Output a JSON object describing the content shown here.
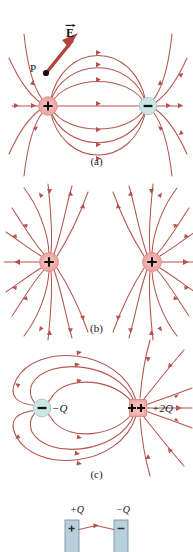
{
  "figure": {
    "colors": {
      "field_line": "#b5544f",
      "field_line_light": "#c77a74",
      "positive_charge_fill": "#f0a9a4",
      "positive_charge_edge": "#d07c77",
      "negative_charge_fill": "#c9e6e4",
      "negative_charge_edge": "#9fc9c6",
      "plate_fill": "#b9cfdc",
      "plate_edge": "#7b95a5",
      "text": "#151515",
      "background": "#ffffff"
    }
  },
  "panel_a": {
    "caption": "(a)",
    "description": "Electric dipole: equal positive and negative point charges",
    "vector_label": "E",
    "vector_arrow_icon": "vector-overbar-arrow",
    "point_label": "P",
    "positive_charge_symbol": "+",
    "negative_charge_symbol": "−",
    "charge_positions": {
      "positive": {
        "cx": 48,
        "cy": 106
      },
      "negative": {
        "cx": 148,
        "cy": 106
      }
    },
    "field_lines": [
      "M48,106 C60,48 136,48 148,106",
      "M48,106 C62,62 134,62 148,106",
      "M48,106 C64,78 132,78 148,106",
      "M48,106 C60,164 136,164 148,106",
      "M48,106 C62,150 134,150 148,106",
      "M48,106 C64,134 132,134 148,106",
      "M14,106 L182,106",
      "M22,42 C26,68 32,88 44,100",
      "M10,62 C18,80 28,94 42,102",
      "M22,170 C26,144 32,124 44,112",
      "M10,150 C18,132 28,118 42,110",
      "M174,42 C170,68 164,88 152,100",
      "M186,62 C178,80 168,94 154,104",
      "M174,170 C170,144 164,124 152,112",
      "M186,150 C178,132 168,118 154,108"
    ]
  },
  "panel_b": {
    "caption": "(b)",
    "description": "Two like positive charges",
    "charge_symbol": "+",
    "charge_positions": {
      "left": {
        "cx": 49,
        "cy": 92
      },
      "right": {
        "cx": 152,
        "cy": 92
      }
    }
  },
  "panel_c": {
    "caption": "(c)",
    "description": "Unequal opposite charges: minus Q and plus two Q",
    "negative_label": "−Q",
    "positive_label": "+2Q",
    "negative_charge_symbol": "−",
    "positive_charge_symbol": "++",
    "charge_positions": {
      "negative": {
        "cx": 42,
        "cy": 68
      },
      "positive": {
        "cx": 138,
        "cy": 68
      }
    }
  },
  "panel_d": {
    "description": "Two oppositely charged parallel plates",
    "left_plate_label": "+Q",
    "right_plate_label": "−Q",
    "left_plate_symbol": "+",
    "right_plate_symbol": "−"
  }
}
